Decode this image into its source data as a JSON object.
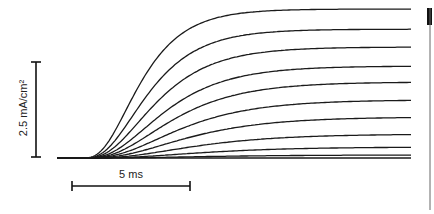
{
  "chart_data": {
    "type": "line",
    "title": "",
    "xlabel": "time (ms)",
    "ylabel": "current density (mA/cm²)",
    "grid": false,
    "legend": null,
    "scale_bars": {
      "vertical": {
        "label": "2.5 mA/cm²",
        "value": 2.5,
        "unit": "mA/cm²"
      },
      "horizontal": {
        "label": "5 ms",
        "value": 5,
        "unit": "ms"
      }
    },
    "x_range_ms": [
      0,
      15
    ],
    "onset_ms": 1.0,
    "series": [
      {
        "name": "trace 1",
        "steady_state": 3.92,
        "tau_ms": 2.2
      },
      {
        "name": "trace 2",
        "steady_state": 3.39,
        "tau_ms": 2.5
      },
      {
        "name": "trace 3",
        "steady_state": 2.92,
        "tau_ms": 2.8
      },
      {
        "name": "trace 4",
        "steady_state": 2.42,
        "tau_ms": 3.1
      },
      {
        "name": "trace 5",
        "steady_state": 2.0,
        "tau_ms": 3.4
      },
      {
        "name": "trace 6",
        "steady_state": 1.53,
        "tau_ms": 3.7
      },
      {
        "name": "trace 7",
        "steady_state": 1.08,
        "tau_ms": 4.0
      },
      {
        "name": "trace 8",
        "steady_state": 0.63,
        "tau_ms": 4.3
      },
      {
        "name": "trace 9",
        "steady_state": 0.29,
        "tau_ms": 4.6
      },
      {
        "name": "trace 10",
        "steady_state": 0.08,
        "tau_ms": 4.8
      },
      {
        "name": "trace 11",
        "steady_state": 0.0,
        "tau_ms": 5.0
      }
    ]
  },
  "labels": {
    "y_scale": "2.5 mA/cm²",
    "x_scale": "5 ms"
  }
}
